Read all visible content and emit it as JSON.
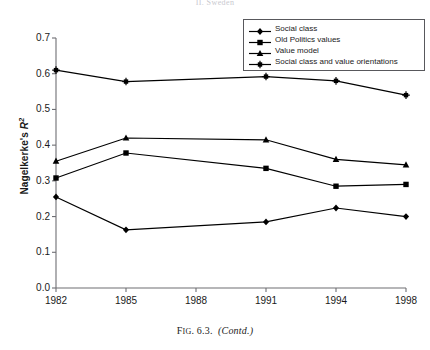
{
  "figure": {
    "top_caption": "II. Sweden",
    "caption_prefix": "F",
    "caption_small": "IG",
    "caption_number": ". 6.3.",
    "caption_contd": "(Contd.)"
  },
  "legend": {
    "position": "top-right",
    "items": [
      {
        "label": "Social class",
        "marker": "diamond-marker",
        "color": "#000000"
      },
      {
        "label": "Old Politics values",
        "marker": "square-marker",
        "color": "#000000"
      },
      {
        "label": "Value model",
        "marker": "triangle-marker",
        "color": "#000000"
      },
      {
        "label": "Social class and value orientations",
        "marker": "star-marker",
        "color": "#000000"
      }
    ]
  },
  "axes": {
    "y_title_text": "Nagelkerke's ",
    "y_title_symbol": "R",
    "y_title_exp": "2",
    "y_ticks": [
      "0.0",
      "0.1",
      "0.2",
      "0.3",
      "0.4",
      "0.5",
      "0.6",
      "0.7"
    ],
    "x_ticks": [
      "1982",
      "1985",
      "1988",
      "1991",
      "1994",
      "1998"
    ],
    "axis_color": "#6e6e73"
  },
  "chart_data": {
    "type": "line",
    "title": "II. Sweden",
    "xlabel": "",
    "ylabel": "Nagelkerke's R2",
    "categories": [
      "1982",
      "1985",
      "1988",
      "1991",
      "1994",
      "1998"
    ],
    "x_positions": [
      1982,
      1985,
      1988,
      1991,
      1994,
      1998
    ],
    "ylim": [
      0.0,
      0.7
    ],
    "ytick_step": 0.1,
    "grid": false,
    "legend_position": "top-right",
    "series": [
      {
        "name": "Social class",
        "marker": "diamond",
        "color": "#000000",
        "x": [
          "1982",
          "1985",
          "1991",
          "1994",
          "1998"
        ],
        "values": [
          0.255,
          0.163,
          0.185,
          0.224,
          0.2
        ]
      },
      {
        "name": "Old Politics values",
        "marker": "square",
        "color": "#000000",
        "x": [
          "1982",
          "1985",
          "1991",
          "1994",
          "1998"
        ],
        "values": [
          0.308,
          0.378,
          0.335,
          0.285,
          0.29
        ]
      },
      {
        "name": "Value model",
        "marker": "triangle",
        "color": "#000000",
        "x": [
          "1982",
          "1985",
          "1991",
          "1994",
          "1998"
        ],
        "values": [
          0.355,
          0.42,
          0.415,
          0.36,
          0.345
        ]
      },
      {
        "name": "Social class and value orientations",
        "marker": "star",
        "color": "#000000",
        "x": [
          "1982",
          "1985",
          "1991",
          "1994",
          "1998"
        ],
        "values": [
          0.61,
          0.578,
          0.592,
          0.58,
          0.54
        ]
      }
    ]
  }
}
